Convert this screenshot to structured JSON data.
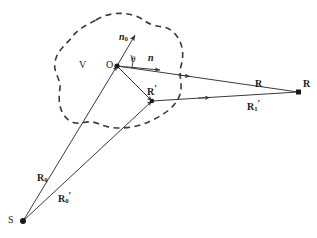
{
  "figure": {
    "kind": "scattering-geometry-diagram",
    "width": 317,
    "height": 238,
    "background_color": "#ffffff",
    "stroke_color": "#3a3a3a",
    "text_color": "#1a1a1a"
  },
  "labels": {
    "volume": "V",
    "origin": "O",
    "theta": "θ",
    "normal_zero": "n",
    "normal_zero_sub": "0",
    "normal": "n",
    "r_prime": "R",
    "r_prime_mark": "′",
    "r_vector": "R",
    "r_point": "R",
    "r_one_prime": "R",
    "r_one_prime_sub": "1",
    "r_one_prime_mark": "′",
    "r_zero": "R",
    "r_zero_sub": "0",
    "r_zero_prime": "R",
    "r_zero_prime_sub": "0",
    "r_zero_prime_mark": "′",
    "source": "S"
  },
  "points": {
    "origin_O": {
      "x": 117,
      "y": 66,
      "label": "O"
    },
    "scatterer_Rprime": {
      "x": 152,
      "y": 101,
      "label": "R′"
    },
    "observation_R": {
      "x": 299,
      "y": 92,
      "label": "R"
    },
    "source_S": {
      "x": 22,
      "y": 222,
      "label": "S"
    }
  },
  "vectors": [
    {
      "name": "n0",
      "from": "O",
      "to_x": 135,
      "to_y": 34,
      "label": "n₀",
      "description": "outward surface normal at origin"
    },
    {
      "name": "n",
      "from": "O",
      "to_x": 161,
      "to_y": 70,
      "label": "n",
      "description": "unit direction vector"
    },
    {
      "name": "R",
      "from": "O",
      "to_x": 299,
      "to_y": 92,
      "label": "R",
      "description": "origin to observation point"
    },
    {
      "name": "Rprime",
      "from": "O",
      "to_x": 152,
      "to_y": 101,
      "label": "R′",
      "description": "origin to scattering element"
    },
    {
      "name": "R1prime",
      "from": "Rprime",
      "to_x": 299,
      "to_y": 92,
      "label": "R₁′",
      "description": "scattering element to observation point"
    },
    {
      "name": "R0",
      "from": "S",
      "to_x": 117,
      "to_y": 66,
      "label": "R₀",
      "description": "source to origin"
    },
    {
      "name": "R0prime",
      "from": "S",
      "to_x": 152,
      "to_y": 101,
      "label": "R₀′",
      "description": "source to scattering element"
    }
  ],
  "region": {
    "name": "V",
    "style": "dashed",
    "description": "closed dashed boundary enclosing scattering volume V"
  }
}
